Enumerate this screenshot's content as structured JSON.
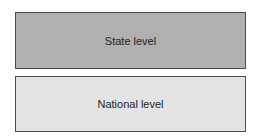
{
  "diagram": {
    "boxes": [
      {
        "label": "State level",
        "fill": "#b0b0b0"
      },
      {
        "label": "National level",
        "fill": "#e4e4e4"
      }
    ]
  }
}
